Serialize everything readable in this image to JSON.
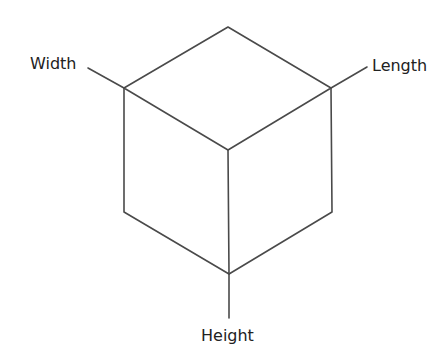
{
  "diagram": {
    "type": "isometric-cube",
    "labels": {
      "width": "Width",
      "length": "Length",
      "height": "Height"
    },
    "colors": {
      "edge": "#4a4a4a",
      "text": "#222222",
      "background": "#ffffff"
    }
  }
}
